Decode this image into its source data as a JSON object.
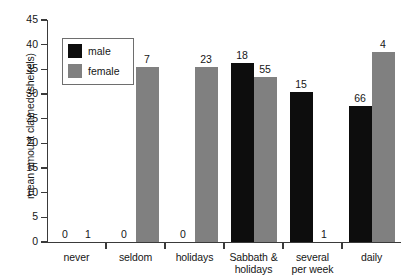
{
  "chart_data": {
    "type": "bar",
    "title": "",
    "subtitle": "",
    "xlabel": "",
    "ylabel": "mean amount claimed (shekels)",
    "ylim": [
      0,
      45
    ],
    "yticks": [
      0,
      5,
      10,
      15,
      20,
      25,
      30,
      35,
      40,
      45
    ],
    "grid": false,
    "legend_position": "upper-left-inside",
    "categories": [
      "never",
      "seldom",
      "holidays",
      "Sabbath & holidays",
      "several per week",
      "daily"
    ],
    "category_lines": [
      [
        "never"
      ],
      [
        "seldom"
      ],
      [
        "holidays"
      ],
      [
        "Sabbath &",
        "holidays"
      ],
      [
        "several",
        "per week"
      ],
      [
        "daily"
      ]
    ],
    "series": [
      {
        "name": "male",
        "color": "#0d0d0d",
        "values": [
          0,
          0,
          0,
          36.3,
          30.5,
          27.5
        ],
        "point_labels": [
          "0",
          "0",
          "0",
          "18",
          "15",
          "66"
        ]
      },
      {
        "name": "female",
        "color": "#808080",
        "values": [
          0,
          35.5,
          35.5,
          33.5,
          0,
          38.5
        ],
        "point_labels": [
          "1",
          "7",
          "23",
          "55",
          "1",
          "4"
        ]
      }
    ]
  },
  "legend": {
    "items": [
      {
        "label": "male",
        "color": "#0d0d0d"
      },
      {
        "label": "female",
        "color": "#808080"
      }
    ]
  },
  "axis": {
    "y_title": "mean amount claimed (shekels)",
    "y_tick_labels": [
      "0",
      "5",
      "10",
      "15",
      "20",
      "25",
      "30",
      "35",
      "40",
      "45"
    ]
  }
}
